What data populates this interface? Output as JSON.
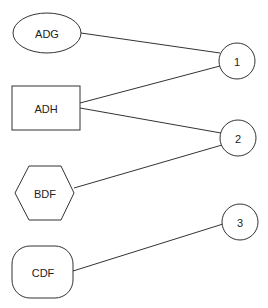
{
  "diagram": {
    "nodes": [
      {
        "id": "ADG",
        "label": "ADG",
        "shape": "ellipse"
      },
      {
        "id": "ADH",
        "label": "ADH",
        "shape": "rectangle"
      },
      {
        "id": "BDF",
        "label": "BDF",
        "shape": "hexagon"
      },
      {
        "id": "CDF",
        "label": "CDF",
        "shape": "rounded-rectangle"
      },
      {
        "id": "1",
        "label": "1",
        "shape": "circle"
      },
      {
        "id": "2",
        "label": "2",
        "shape": "circle"
      },
      {
        "id": "3",
        "label": "3",
        "shape": "circle"
      }
    ],
    "edges": [
      {
        "from": "ADG",
        "to": "1"
      },
      {
        "from": "ADH",
        "to": "1"
      },
      {
        "from": "ADH",
        "to": "2"
      },
      {
        "from": "BDF",
        "to": "2"
      },
      {
        "from": "CDF",
        "to": "3"
      }
    ],
    "colors": {
      "stroke": "#333333",
      "background": "#ffffff"
    }
  }
}
